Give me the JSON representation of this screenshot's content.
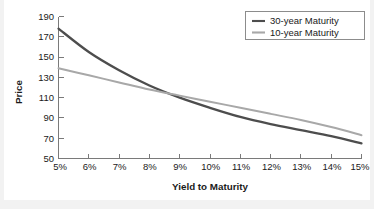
{
  "chart_data": {
    "type": "line",
    "title": "",
    "xlabel": "Yield to Maturity",
    "ylabel": "Price",
    "xlim": [
      5,
      15
    ],
    "ylim": [
      50,
      190
    ],
    "grid": false,
    "legend_position": "top-right",
    "x_tick_labels": [
      "5%",
      "6%",
      "7%",
      "8%",
      "9%",
      "10%",
      "11%",
      "12%",
      "13%",
      "14%",
      "15%"
    ],
    "y_tick_labels": [
      "50",
      "70",
      "90",
      "110",
      "130",
      "150",
      "170",
      "190"
    ],
    "x": [
      5,
      6,
      7,
      8,
      9,
      10,
      11,
      12,
      13,
      14,
      15
    ],
    "series": [
      {
        "name": "30-year Maturity",
        "color": "#4d4d4d",
        "values": [
          178,
          155,
          137,
          122,
          110,
          100,
          91,
          84,
          78,
          72,
          65
        ]
      },
      {
        "name": "10-year Maturity",
        "color": "#a8a8a8",
        "values": [
          139,
          132,
          125,
          118,
          112,
          106,
          100,
          94,
          88,
          81,
          73
        ]
      }
    ]
  },
  "legend": {
    "items": [
      {
        "label": "30-year Maturity"
      },
      {
        "label": "10-year Maturity"
      }
    ]
  },
  "axes": {
    "y_title": "Price",
    "x_title": "Yield to Maturity"
  },
  "colors": {
    "series_30y": "#4d4d4d",
    "series_10y": "#a8a8a8",
    "axis": "#7a7a7a",
    "text": "#1a1a1a",
    "canvas": "#ffffff",
    "frame": "#f2f2f2"
  }
}
